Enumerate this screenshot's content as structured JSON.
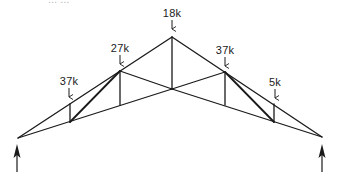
{
  "caption_partial": "... ...",
  "truss": {
    "type": "symmetric roof truss",
    "joints": {
      "left_support": [
        18,
        138
      ],
      "right_support": [
        322,
        137
      ],
      "apex": [
        172,
        37
      ],
      "top_left_1": [
        70,
        104
      ],
      "top_left_2": [
        120,
        71
      ],
      "top_right_2": [
        225,
        72
      ],
      "top_right_1": [
        274,
        104
      ],
      "bottom_left_1": [
        70,
        122
      ],
      "bottom_left_2": [
        120,
        105
      ],
      "bottom_center": [
        172,
        89
      ],
      "bottom_right_2": [
        225,
        105
      ],
      "bottom_right_1": [
        274,
        122
      ]
    }
  },
  "loads": [
    {
      "label": "37k",
      "x": 69,
      "y": 75
    },
    {
      "label": "27k",
      "x": 120,
      "y": 42
    },
    {
      "label": "18k",
      "x": 172,
      "y": 7
    },
    {
      "label": "37k",
      "x": 225,
      "y": 44
    },
    {
      "label": "5k",
      "x": 275,
      "y": 76
    }
  ],
  "reactions": [
    {
      "name": "left",
      "x": 17
    },
    {
      "name": "right",
      "x": 322
    }
  ],
  "colors": {
    "line": "#1a1a1a",
    "background": "#ffffff"
  }
}
